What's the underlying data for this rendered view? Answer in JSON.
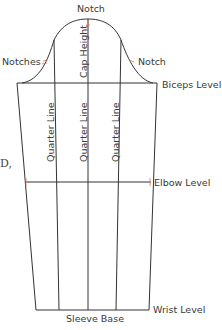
{
  "diagram": {
    "labels": {
      "notch_top": "Notch",
      "notches_left": "Notches",
      "notch_right": "Notch",
      "biceps_level": "Biceps Level",
      "cap_height": "Cap Height",
      "quarter_line_left": "Quarter Line",
      "quarter_line_center": "Quarter Line",
      "quarter_line_right": "Quarter Line",
      "elbow_level": "Elbow Level",
      "wrist_level": "Wrist Level",
      "sleeve_base": "Sleeve Base"
    },
    "edge_artifact": "D,",
    "colors": {
      "line": "#333333",
      "notch_mark": "#d9776b",
      "label": "#3a3a3a",
      "background": "#ffffff"
    }
  }
}
